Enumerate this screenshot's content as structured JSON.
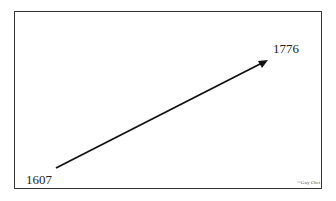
{
  "timeline": {
    "start_label": "1607",
    "end_label": "1776",
    "credit": "©Guy Chet",
    "arrow_color": "#111111"
  }
}
